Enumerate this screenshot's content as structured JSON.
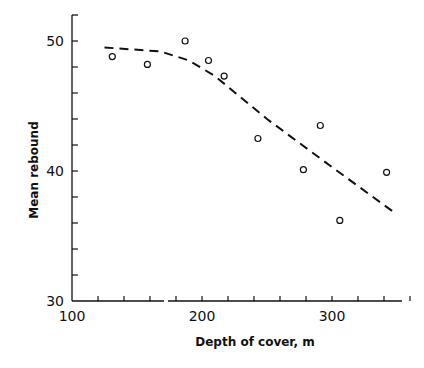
{
  "chart_data": {
    "type": "scatter",
    "title": "",
    "xlabel": "Depth of cover, m",
    "ylabel": "Mean rebound",
    "xlim": [
      100,
      360
    ],
    "ylim": [
      30,
      52
    ],
    "x_ticks": [
      100,
      200,
      300
    ],
    "y_ticks": [
      30,
      40,
      50
    ],
    "grid": false,
    "series": [
      {
        "name": "observed",
        "marker": "open-circle",
        "x": [
          131,
          158,
          187,
          205,
          217,
          243,
          278,
          291,
          306,
          342
        ],
        "y": [
          48.8,
          48.2,
          50.0,
          48.5,
          47.3,
          42.5,
          40.1,
          43.5,
          36.2,
          39.9
        ]
      },
      {
        "name": "trend",
        "style": "dashed",
        "x": [
          125,
          168,
          190,
          210,
          250,
          300,
          348
        ],
        "y": [
          49.5,
          49.2,
          48.5,
          47.3,
          44.0,
          40.3,
          36.8
        ]
      }
    ]
  }
}
